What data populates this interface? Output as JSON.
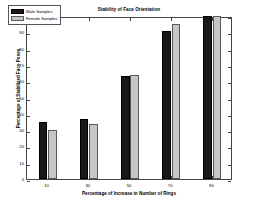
{
  "chart_data": {
    "type": "bar",
    "title": "Stability of Face Orientation",
    "xlabel": "Percentage of Increase in Number of Rings",
    "ylabel": "Percentage of Stabilized Face Poses",
    "categories": [
      "10",
      "30",
      "50",
      "70",
      "90"
    ],
    "series": [
      {
        "name": "Male Samples",
        "color": "#191919",
        "values": [
          35,
          37,
          63,
          91,
          100
        ]
      },
      {
        "name": "Female Samples",
        "color": "#c6c6c6",
        "values": [
          30,
          34,
          64,
          95,
          100
        ]
      }
    ],
    "ylim": [
      0,
      100
    ],
    "yticks": [
      "0",
      "10",
      "20",
      "30",
      "40",
      "50",
      "60",
      "70",
      "80",
      "90",
      "100"
    ],
    "ytick_values": [
      0,
      10,
      20,
      30,
      40,
      50,
      60,
      70,
      80,
      90,
      100
    ],
    "xticks": [
      "10",
      "30",
      "50",
      "70",
      "90"
    ],
    "grid": false,
    "legend_position": "upper left",
    "legend_entries": [
      "Male Samples",
      "Female Samples"
    ],
    "box_border_color": "#444444",
    "background_color": "#ffffff"
  }
}
